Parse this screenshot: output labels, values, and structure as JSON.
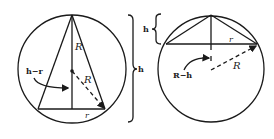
{
  "figure": {
    "left": {
      "labels": {
        "R_upper": "R",
        "R_diag": "R",
        "h_minus_r": "h−r",
        "r": "r",
        "h_brace": "h"
      }
    },
    "right": {
      "labels": {
        "h_brace": "h",
        "r": "r",
        "R": "R",
        "R_minus_h": "R−h"
      }
    },
    "colors": {
      "stroke": "#1a1a1a",
      "background": "#ffffff"
    }
  }
}
